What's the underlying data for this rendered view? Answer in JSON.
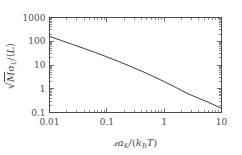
{
  "figure": {
    "background_color": "#ffffff",
    "frame_color": "#4a4a4a",
    "curve_color": "#3c3c3c"
  },
  "axes": {
    "x": {
      "label_plain": "Ta_K/(k_B T)",
      "label_parts": {
        "script_t": "ᵏ",
        "t_cal": "T",
        "a": "a",
        "a_sub": "K",
        "slash": "/(",
        "k": "k",
        "k_sub": "B",
        "t_italic": "T",
        "close": ")"
      },
      "tick_labels": [
        "0.01",
        "0.1",
        "1",
        "10"
      ],
      "tick_values": [
        0.01,
        0.1,
        1,
        10
      ],
      "scale": "log",
      "range": [
        0.01,
        10
      ]
    },
    "y": {
      "label_plain": "sqrt(M) sigma_L / <L>",
      "label_parts": {
        "sqrt": "√",
        "m_italic": "M",
        "sigma": "σ",
        "sigma_sub": "L",
        "slash": "/⟨",
        "l_italic": "L",
        "close": "⟩"
      },
      "tick_labels": [
        "1000",
        "100",
        "10",
        "1",
        "0.1"
      ],
      "tick_values": [
        1000,
        100,
        10,
        1,
        0.1
      ],
      "scale": "log",
      "range": [
        0.1,
        1000
      ]
    }
  },
  "chart_data": {
    "type": "line",
    "title": "",
    "subtitle": "",
    "xlabel": "Ta_K/(k_B T)",
    "ylabel": "sqrt(M) sigma_L/<L>",
    "xscale": "log",
    "yscale": "log",
    "xlim": [
      0.01,
      10
    ],
    "ylim": [
      0.1,
      1000
    ],
    "grid": false,
    "legend": null,
    "xticks": [
      0.01,
      0.1,
      1,
      10
    ],
    "yticks": [
      0.1,
      1,
      10,
      100,
      1000
    ],
    "minor_ticks": true,
    "tick_direction": "in",
    "frame": "full-box",
    "series": [
      {
        "name": "sigma_L curve",
        "color": "#3c3c3c",
        "linewidth": 1,
        "x": [
          0.01,
          0.0158,
          0.0251,
          0.0398,
          0.0631,
          0.1,
          0.158,
          0.251,
          0.398,
          0.631,
          1.0,
          1.58,
          2.51,
          3.98,
          6.31,
          10.0
        ],
        "y": [
          160.0,
          109.0,
          74.0,
          50.0,
          33.5,
          22.0,
          14.2,
          9.0,
          5.6,
          3.4,
          2.0,
          1.15,
          0.64,
          0.4,
          0.25,
          0.15
        ]
      }
    ],
    "annotations": []
  }
}
